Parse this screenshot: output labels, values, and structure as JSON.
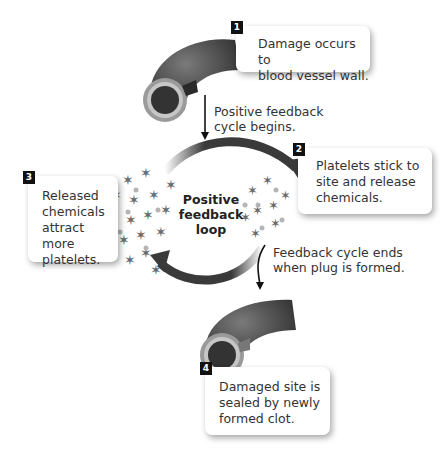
{
  "center_label": "Positive\nfeedback\nloop",
  "steps": [
    {
      "number": "1",
      "text": "Damage occurs to\nblood vessel wall."
    },
    {
      "number": "2",
      "text": "Platelets stick to\nsite and release\nchemicals."
    },
    {
      "number": "3",
      "text": "Released\nchemicals\nattract more\nplatelets."
    },
    {
      "number": "4",
      "text": "Damaged site is\nsealed by newly\nformed clot."
    }
  ],
  "annotations": {
    "cycle_begins": "Positive feedback\ncycle begins.",
    "cycle_ends": "Feedback cycle ends\nwhen plug is formed."
  },
  "colors": {
    "arrow": "#3a3a3a",
    "vessel": "#4a4a4a",
    "platelet": "#6b6b6b",
    "dot": "#b5b5b5"
  }
}
